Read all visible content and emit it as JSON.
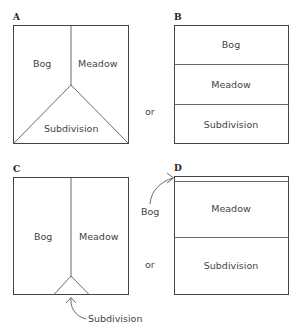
{
  "panels": {
    "A": {
      "label": "A",
      "regions": [
        "Bog",
        "Meadow",
        "Subdivision"
      ]
    },
    "B": {
      "label": "B",
      "regions": [
        "Bog",
        "Meadow",
        "Subdivision"
      ]
    },
    "C": {
      "label": "C",
      "regions": [
        "Bog",
        "Meadow"
      ],
      "callout": "Subdivision"
    },
    "D": {
      "label": "D",
      "regions": [
        "Meadow",
        "Subdivision"
      ],
      "callout": "Bog"
    }
  },
  "connectors": {
    "top": "or",
    "bottom": "or"
  },
  "colors": {
    "line": "#6a6a6a",
    "border": "#444444",
    "text": "#444444"
  }
}
